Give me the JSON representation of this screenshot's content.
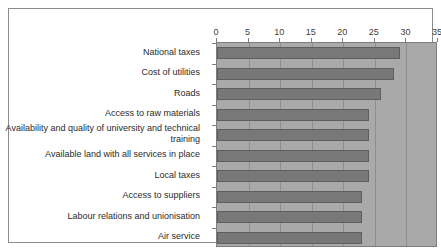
{
  "chart_data": {
    "type": "bar",
    "orientation": "horizontal",
    "title": "",
    "xlabel": "",
    "ylabel": "",
    "xlim": [
      0,
      35
    ],
    "xticks": [
      0,
      5,
      10,
      15,
      20,
      25,
      30,
      35
    ],
    "grid": true,
    "legend": false,
    "categories": [
      "National taxes",
      "Cost of utilities",
      "Roads",
      "Access to raw materials",
      "Availability and quality of university and technical training",
      "Available land with all services in place",
      "Local taxes",
      "Access to suppliers",
      "Labour relations and unionisation",
      "Air service"
    ],
    "values": [
      29,
      28,
      26,
      24,
      24,
      24,
      24,
      23,
      23,
      23
    ],
    "colors": {
      "bar_fill": "#787878",
      "bar_edge": "#5e5e5e",
      "plot_background": "#a9a9a9",
      "gridline": "#8e8e8e",
      "figure_background": "#ffffff",
      "frame_border": "#8c8c8c",
      "text": "#2b2b2b"
    }
  }
}
